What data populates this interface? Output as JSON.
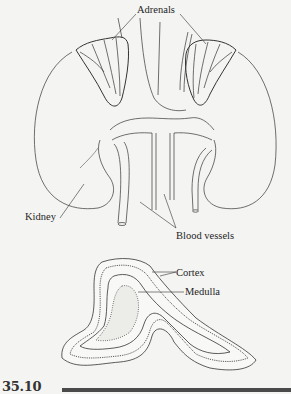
{
  "figure": {
    "number": "35.10",
    "upper_illustration": "adrenal glands atop kidneys with blood vessels",
    "lower_illustration": "cross-section of adrenal gland"
  },
  "labels": {
    "adrenals": "Adrenals",
    "kidney": "Kidney",
    "blood_vessels": "Blood vessels",
    "cortex": "Cortex",
    "medulla": "Medulla"
  },
  "colors": {
    "background": "#f4f4f2",
    "ink": "#222222",
    "rule": "#4a4a4a"
  }
}
